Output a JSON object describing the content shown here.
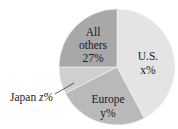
{
  "chart_data": {
    "type": "pie",
    "title": "",
    "slices": [
      {
        "name": "U.S.",
        "value_label": "x%",
        "value": null,
        "color": "#e4e4e4"
      },
      {
        "name": "Europe",
        "value_label": "y%",
        "value": null,
        "color": "#b9b9b9"
      },
      {
        "name": "Japan",
        "value_label": "z%",
        "value": null,
        "color": "#cfcfcf"
      },
      {
        "name": "All others",
        "value_label": "27%",
        "value": 27,
        "color": "#a8a8a8"
      }
    ],
    "labels": {
      "us_name": "U.S.",
      "us_value": "x%",
      "europe_name": "Europe",
      "europe_value": "y%",
      "japan_name": "Japan",
      "japan_value": "z%",
      "others_line1": "All",
      "others_line2": "others",
      "others_value": "27%"
    },
    "legend": "none",
    "grid": false
  }
}
